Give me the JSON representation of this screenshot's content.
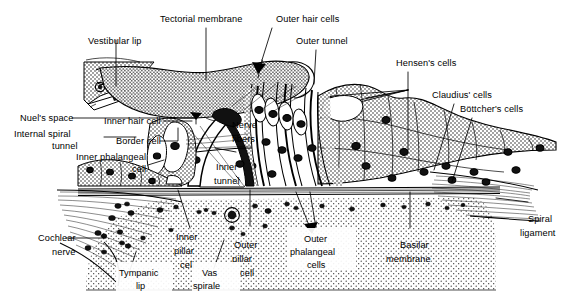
{
  "figure": {
    "width": 570,
    "height": 304,
    "background_color": "#ffffff",
    "ink_color": "#000000",
    "style": "black-and-white stippled line drawing / histology schematic"
  },
  "labels": {
    "tectorial_membrane": "Tectorial membrane",
    "outer_hair_cells": "Outer hair cells",
    "outer_tunnel": "Outer tunnel",
    "vestibular_lip": "Vestibular lip",
    "hensens_cells": "Hensen's cells",
    "claudius_cells": "Claudius' cells",
    "bottchers_cells": "Böttcher's cells",
    "nuels_space": "Nuel's space",
    "internal_spiral_tunnel_l1": "Internal spiral",
    "internal_spiral_tunnel_l2": "tunnel",
    "inner_hair_cell": "Inner hair cell",
    "border_cell": "Border cell",
    "inner_phalangeal_l1": "Inner phalangeal",
    "inner_phalangeal_l2": "cell",
    "nerve_fibers_l1": "Nerve",
    "nerve_fibers_l2": "fibers",
    "inner_tunnel_l1": "Inner",
    "inner_tunnel_l2": "tunnel",
    "cochlear_nerve_l1": "Cochlear",
    "cochlear_nerve_l2": "nerve",
    "tympanic_lip_l1": "Tympanic",
    "tympanic_lip_l2": "lip",
    "inner_pillar_l1": "Inner",
    "inner_pillar_l2": "pillar",
    "inner_pillar_l3": "cell",
    "vas_spirale_l1": "Vas",
    "vas_spirale_l2": "spirale",
    "outer_pillar_l1": "Outer",
    "outer_pillar_l2": "pillar",
    "outer_pillar_l3": "cell",
    "outer_phalangeal_l1": "Outer",
    "outer_phalangeal_l2": "phalangeal",
    "outer_phalangeal_l3": "cells",
    "basilar_membrane_l1": "Basilar",
    "basilar_membrane_l2": "membrane",
    "spiral_ligament_l1": "Spiral",
    "spiral_ligament_l2": "ligament"
  },
  "structures": [
    {
      "name": "tectorial-membrane",
      "texture": "stipple",
      "note": "wavy band over the hair cells"
    },
    {
      "name": "spiral-limbus",
      "texture": "stipple",
      "note": "left wedge bearing the vestibular lip"
    },
    {
      "name": "inner-hair-cell",
      "texture": "white",
      "note": "single flask-shaped cell"
    },
    {
      "name": "inner-tunnel",
      "texture": "white",
      "note": "tunnel of Corti between pillar cells"
    },
    {
      "name": "outer-tunnel",
      "texture": "white"
    },
    {
      "name": "outer-hair-cells",
      "texture": "white",
      "count": 3
    },
    {
      "name": "hensens-cells",
      "texture": "stipple"
    },
    {
      "name": "claudius-cells",
      "texture": "stipple"
    },
    {
      "name": "bottchers-cells",
      "texture": "stipple"
    },
    {
      "name": "basilar-membrane",
      "texture": "parallel-lines"
    },
    {
      "name": "tympanic-region",
      "texture": "fine-stipple"
    },
    {
      "name": "spiral-ligament",
      "texture": "fanning-fibers"
    },
    {
      "name": "cochlear-nerve",
      "texture": "fiber-bundle"
    }
  ]
}
